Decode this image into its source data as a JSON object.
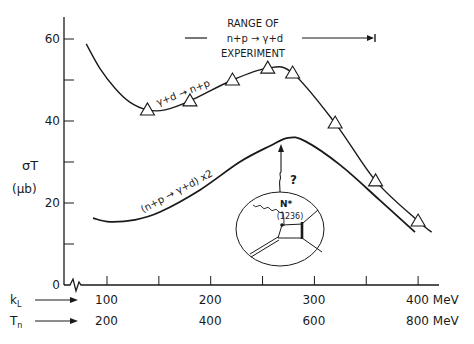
{
  "chart_data": {
    "type": "line",
    "title": "",
    "ylabel": "σT",
    "ylabel_unit": "(μb)",
    "ylim": [
      0,
      65
    ],
    "yticks": [
      0,
      10,
      20,
      30,
      40,
      50,
      60
    ],
    "ytick_labels": [
      "0",
      "",
      "20",
      "",
      "40",
      "",
      "60"
    ],
    "xlim": [
      65,
      420
    ],
    "x_axes": [
      {
        "name": "kL",
        "label": "k",
        "label_sub": "L",
        "ticks": [
          100,
          200,
          300,
          400
        ],
        "tick_labels": [
          "100",
          "200",
          "300",
          "400 MeV"
        ]
      },
      {
        "name": "Tn",
        "label": "T",
        "label_sub": "n",
        "ticks": [
          100,
          200,
          300,
          400
        ],
        "tick_labels": [
          "200",
          "400",
          "600",
          "800 MeV"
        ]
      }
    ],
    "minor_xticks": [
      150,
      250,
      350
    ],
    "axis_break": true,
    "grid": false,
    "series": [
      {
        "name": "γ+d → n+p",
        "label": "γ+d → n+p",
        "curve": [
          [
            80,
            58.8
          ],
          [
            93,
            52.9
          ],
          [
            107.7,
            48
          ],
          [
            122,
            44.6
          ],
          [
            139,
            42.7
          ],
          [
            156,
            42.7
          ],
          [
            180,
            44.9
          ],
          [
            221,
            50
          ],
          [
            255,
            52.9
          ],
          [
            279,
            51.7
          ],
          [
            320,
            39.5
          ],
          [
            359,
            25.4
          ],
          [
            400,
            15.6
          ],
          [
            413,
            12.9
          ]
        ],
        "points": [
          [
            139,
            42.7
          ],
          [
            180,
            44.9
          ],
          [
            221,
            50
          ],
          [
            255,
            52.9
          ],
          [
            279,
            51.7
          ],
          [
            320,
            39.5
          ],
          [
            359,
            25.4
          ],
          [
            400,
            15.6
          ]
        ],
        "marker": "triangle"
      },
      {
        "name": "(n+p → γ+d) x2",
        "label": "(n+p → γ+d) x2",
        "curve": [
          [
            86.5,
            16.3
          ],
          [
            102.9,
            15.4
          ],
          [
            127,
            15.9
          ],
          [
            151,
            17.8
          ],
          [
            189.7,
            23.2
          ],
          [
            228,
            30
          ],
          [
            257,
            33.9
          ],
          [
            274.5,
            35.9
          ],
          [
            291,
            35.1
          ],
          [
            324.7,
            29.3
          ],
          [
            363,
            20.7
          ],
          [
            397,
            12.9
          ]
        ],
        "points": [],
        "marker": "none"
      }
    ],
    "annotations": {
      "range_title": "RANGE OF",
      "range_reaction": "n+p → γ+d",
      "range_sub": "EXPERIMENT",
      "range_kL": [
        97,
        370
      ],
      "question": "?",
      "inset_label": "N*",
      "inset_mass": "(1236)"
    }
  }
}
